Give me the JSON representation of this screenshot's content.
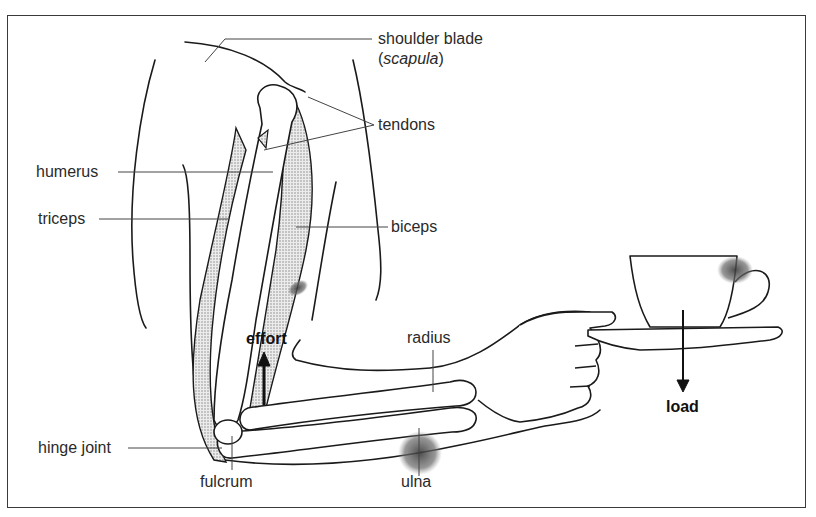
{
  "diagram": {
    "labels": {
      "shoulder_blade": "shoulder blade",
      "scapula_open": "(",
      "scapula": "scapula",
      "scapula_close": ")",
      "tendons": "tendons",
      "humerus": "humerus",
      "triceps": "triceps",
      "biceps": "biceps",
      "effort": "effort",
      "radius": "radius",
      "load": "load",
      "hinge_joint": "hinge joint",
      "fulcrum": "fulcrum",
      "ulna": "ulna"
    },
    "arrows": [
      {
        "name": "effort",
        "direction": "up"
      },
      {
        "name": "load",
        "direction": "down"
      }
    ],
    "colors": {
      "line": "#1a1a1a",
      "leader": "#444444",
      "muscle_fill": "#d9d9d9",
      "stain": "#555555",
      "background": "#ffffff"
    }
  }
}
